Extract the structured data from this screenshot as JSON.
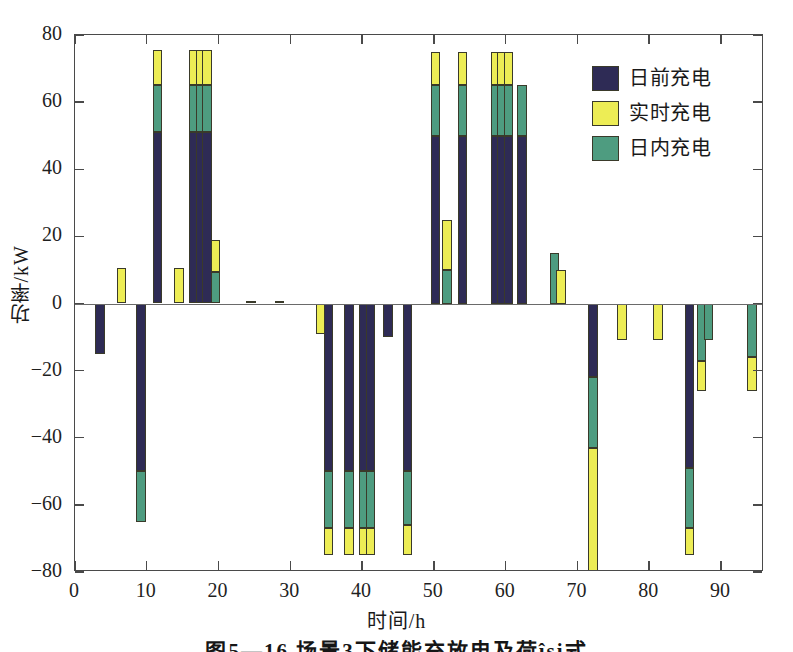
{
  "chart_data": {
    "type": "bar",
    "subtype": "stacked-bar",
    "title": "",
    "xlabel": "时间/h",
    "ylabel": "功率/kW",
    "xlim": [
      0,
      96
    ],
    "ylim": [
      -80,
      80
    ],
    "xticks": [
      0,
      10,
      20,
      30,
      40,
      50,
      60,
      70,
      80,
      90
    ],
    "yticks": [
      80,
      60,
      40,
      20,
      0,
      -20,
      -40,
      -60,
      -80
    ],
    "grid": false,
    "legend_position": "upper right",
    "series": [
      {
        "name": "日前充电",
        "color": "#2e2b55"
      },
      {
        "name": "实时充电",
        "color": "#eded55"
      },
      {
        "name": "日内充电",
        "color": "#4e9c80"
      }
    ],
    "bars": [
      {
        "x": 3.5,
        "day_ahead": -15,
        "intraday": 0,
        "realtime": 0
      },
      {
        "x": 6.5,
        "day_ahead": 0,
        "intraday": 0,
        "realtime": 10.5
      },
      {
        "x": 9.2,
        "day_ahead": -50,
        "intraday": -15,
        "realtime": 0
      },
      {
        "x": 11.5,
        "day_ahead": 51,
        "intraday": 14,
        "realtime": 10.5
      },
      {
        "x": 14.5,
        "day_ahead": 0,
        "intraday": 0,
        "realtime": 10.5
      },
      {
        "x": 16.6,
        "day_ahead": 51,
        "intraday": 14,
        "realtime": 10.5
      },
      {
        "x": 17.5,
        "day_ahead": 51,
        "intraday": 14,
        "realtime": 10.5
      },
      {
        "x": 18.4,
        "day_ahead": 51,
        "intraday": 14,
        "realtime": 10.5
      },
      {
        "x": 19.6,
        "day_ahead": 0,
        "intraday": 9.5,
        "realtime": 9.5
      },
      {
        "x": 24.5,
        "day_ahead": 0,
        "intraday": 0,
        "realtime": 0.6
      },
      {
        "x": 28.5,
        "day_ahead": 0,
        "intraday": 0,
        "realtime": 0.6
      },
      {
        "x": 34.2,
        "day_ahead": 0,
        "intraday": 0,
        "realtime": -9
      },
      {
        "x": 35.3,
        "day_ahead": -50,
        "intraday": -17,
        "realtime": -8
      },
      {
        "x": 38.2,
        "day_ahead": -50,
        "intraday": -17,
        "realtime": -8
      },
      {
        "x": 40.2,
        "day_ahead": -50,
        "intraday": -17,
        "realtime": -8
      },
      {
        "x": 41.2,
        "day_ahead": -50,
        "intraday": -17,
        "realtime": -8
      },
      {
        "x": 43.6,
        "day_ahead": -10,
        "intraday": 0,
        "realtime": 0
      },
      {
        "x": 46.3,
        "day_ahead": -50,
        "intraday": -16,
        "realtime": -9
      },
      {
        "x": 50.2,
        "day_ahead": 50,
        "intraday": 15,
        "realtime": 10
      },
      {
        "x": 51.8,
        "day_ahead": 0,
        "intraday": 10,
        "realtime": 15
      },
      {
        "x": 54.0,
        "day_ahead": 50,
        "intraday": 15,
        "realtime": 10
      },
      {
        "x": 58.6,
        "day_ahead": 50,
        "intraday": 15,
        "realtime": 10
      },
      {
        "x": 59.5,
        "day_ahead": 50,
        "intraday": 15,
        "realtime": 10
      },
      {
        "x": 60.4,
        "day_ahead": 50,
        "intraday": 15,
        "realtime": 10
      },
      {
        "x": 62.3,
        "day_ahead": 50,
        "intraday": 15,
        "realtime": 0
      },
      {
        "x": 66.8,
        "day_ahead": 0,
        "intraday": 15,
        "realtime": 0
      },
      {
        "x": 67.7,
        "day_ahead": 0,
        "intraday": 0,
        "realtime": 10
      },
      {
        "x": 72.2,
        "day_ahead": -22,
        "intraday": -21,
        "realtime": -200
      },
      {
        "x": 76.2,
        "day_ahead": 0,
        "intraday": 0,
        "realtime": -11
      },
      {
        "x": 81.2,
        "day_ahead": 0,
        "intraday": 0,
        "realtime": -11
      },
      {
        "x": 85.6,
        "day_ahead": -49,
        "intraday": -18,
        "realtime": -8
      },
      {
        "x": 87.3,
        "day_ahead": 0,
        "intraday": -17,
        "realtime": -9
      },
      {
        "x": 88.3,
        "day_ahead": 0,
        "intraday": -11,
        "realtime": 0
      },
      {
        "x": 94.3,
        "day_ahead": 0,
        "intraday": -16,
        "realtime": -10
      }
    ]
  },
  "legend": {
    "items": [
      {
        "label": "日前充电",
        "color": "#2e2b55"
      },
      {
        "label": "实时充电",
        "color": "#eded55"
      },
      {
        "label": "日内充电",
        "color": "#4e9c80"
      }
    ]
  },
  "axes": {
    "y_title": "功率/kW",
    "x_title": "时间/h",
    "y_tick_labels": [
      "80",
      "60",
      "40",
      "20",
      "0",
      "−20",
      "−40",
      "−60",
      "−80"
    ],
    "x_tick_labels": [
      "0",
      "10",
      "20",
      "30",
      "40",
      "50",
      "60",
      "70",
      "80",
      "90"
    ]
  },
  "caption": "图5—16 场景3下储能充放电及荷își式"
}
